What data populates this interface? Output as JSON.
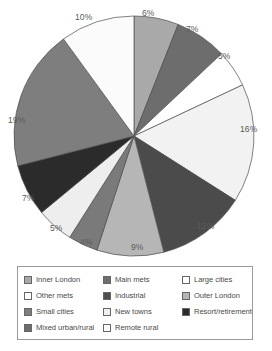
{
  "chart_data": {
    "type": "pie",
    "title": "",
    "labels": [
      "Inner London",
      "Main mets",
      "Large cities",
      "Other mets",
      "Outer London",
      "Small cities",
      "Industrial",
      "New towns",
      "Resort/retirement",
      "Mixed urban/rural",
      "Remote rural"
    ],
    "values": [
      6,
      7,
      5,
      16,
      12,
      9,
      4,
      5,
      7,
      19,
      10
    ],
    "value_labels": [
      "6%",
      "7%",
      "5%",
      "16%",
      "12%",
      "9%",
      "4%",
      "5%",
      "7%",
      "19%",
      "10%"
    ],
    "colors": [
      "#a9a9a9",
      "#6d6d6d",
      "#ffffff",
      "#f2f2f2",
      "#4b4b4b",
      "#b6b6b6",
      "#7a7a7a",
      "#eeeeee",
      "#2b2b2b",
      "#7e7e7e",
      "#fbfbfb"
    ],
    "start_angle_deg": 0,
    "direction": "clockwise",
    "legend_position": "bottom",
    "grid": false
  },
  "legend": {
    "items": [
      {
        "label": "Inner London",
        "color": "#a9a9a9"
      },
      {
        "label": "Main mets",
        "color": "#6d6d6d"
      },
      {
        "label": "Large cities",
        "color": "#ffffff"
      },
      {
        "label": "Other mets",
        "color": "#ffffff"
      },
      {
        "label": "Industrial",
        "color": "#4f4f4f"
      },
      {
        "label": "Outer London",
        "color": "#b6b6b6"
      },
      {
        "label": "Small cities",
        "color": "#7e7e7e"
      },
      {
        "label": "New towns",
        "color": "#efefef"
      },
      {
        "label": "Resort/retirement",
        "color": "#2b2b2b"
      },
      {
        "label": "Mixed urban/rural",
        "color": "#6d6d6d"
      },
      {
        "label": "Remote rural",
        "color": "#fbfbfb"
      }
    ]
  },
  "slice_labels": [
    {
      "text": "6%",
      "left": 142,
      "top": 9
    },
    {
      "text": "7%",
      "left": 186,
      "top": 25
    },
    {
      "text": "5%",
      "left": 218,
      "top": 52
    },
    {
      "text": "16%",
      "left": 240,
      "top": 125
    },
    {
      "text": "12%",
      "left": 197,
      "top": 222
    },
    {
      "text": "9%",
      "left": 131,
      "top": 243
    },
    {
      "text": "4%",
      "left": 80,
      "top": 238
    },
    {
      "text": "5%",
      "left": 50,
      "top": 224
    },
    {
      "text": "7%",
      "left": 22,
      "top": 194
    },
    {
      "text": "19%",
      "left": 8,
      "top": 116
    },
    {
      "text": "10%",
      "left": 75,
      "top": 13
    }
  ]
}
